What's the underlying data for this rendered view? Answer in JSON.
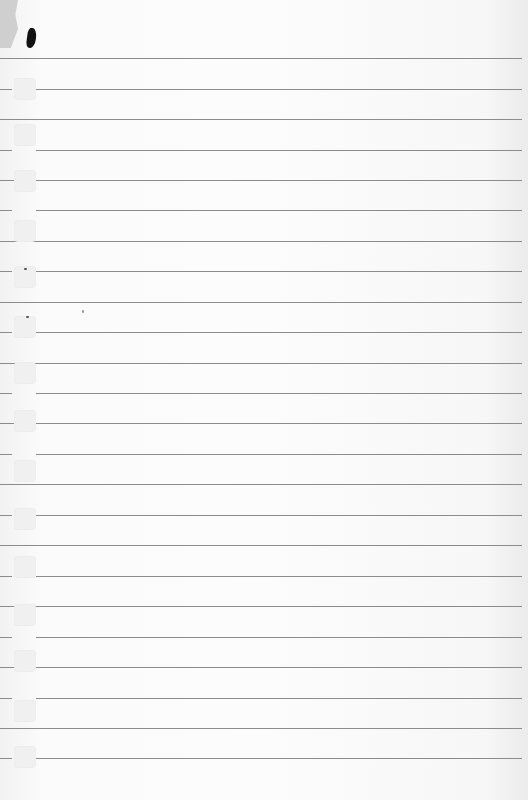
{
  "paper": {
    "type": "lined notebook paper",
    "background_color": "#fcfcfc",
    "rule_color": "#8c8c8c",
    "rule_count": 24,
    "rule_positions_y": [
      58,
      89,
      119,
      150,
      180,
      210,
      241,
      271,
      302,
      332,
      363,
      393,
      423,
      454,
      484,
      515,
      545,
      576,
      606,
      637,
      667,
      698,
      728,
      758
    ],
    "hole_positions_y": [
      78,
      124,
      170,
      220,
      266,
      316,
      362,
      410,
      460,
      508,
      556,
      604,
      650,
      700,
      746
    ]
  }
}
